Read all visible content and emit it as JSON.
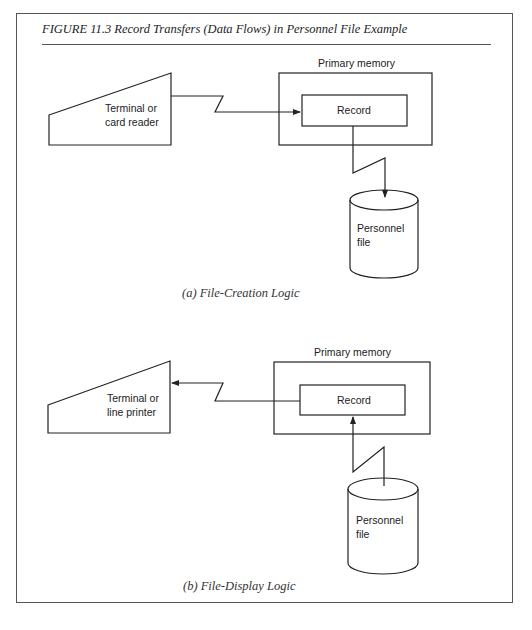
{
  "figure": {
    "title": "FIGURE 11.3 Record Transfers (Data Flows) in Personnel File Example"
  },
  "panel_a": {
    "caption": "(a)  File-Creation Logic",
    "device_label_line1": "Terminal or",
    "device_label_line2": "card reader",
    "memory_label": "Primary memory",
    "record_label": "Record",
    "file_label_line1": "Personnel",
    "file_label_line2": "file",
    "flows": [
      "device → record",
      "record → file"
    ]
  },
  "panel_b": {
    "caption": "(b)  File-Display Logic",
    "device_label_line1": "Terminal or",
    "device_label_line2": "line printer",
    "memory_label": "Primary memory",
    "record_label": "Record",
    "file_label_line1": "Personnel",
    "file_label_line2": "file",
    "flows": [
      "record → device",
      "file → record"
    ]
  },
  "colors": {
    "stroke": "#222222",
    "frame": "#555555",
    "background": "#ffffff"
  }
}
